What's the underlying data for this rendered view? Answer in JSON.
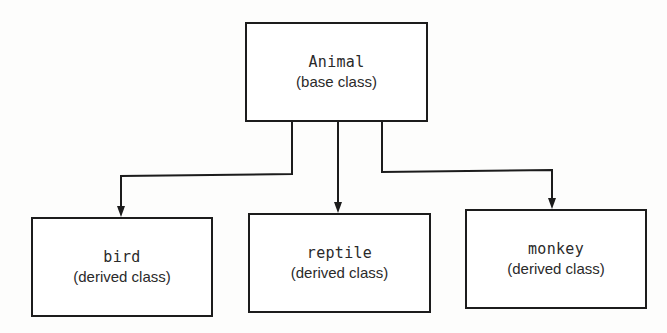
{
  "diagram": {
    "type": "class-hierarchy",
    "colors": {
      "stroke": "#1c1c1c",
      "text": "#2a2a2a",
      "background": "#fdfdfc",
      "box_fill": "#ffffff"
    },
    "nodes": [
      {
        "id": "animal",
        "name": "Animal",
        "kind": "(base class)",
        "x": 245,
        "y": 22,
        "w": 183,
        "h": 100
      },
      {
        "id": "bird",
        "name": "bird",
        "kind": "(derived class)",
        "x": 31,
        "y": 217,
        "w": 182,
        "h": 100
      },
      {
        "id": "reptile",
        "name": "reptile",
        "kind": "(derived class)",
        "x": 248,
        "y": 213,
        "w": 183,
        "h": 100
      },
      {
        "id": "monkey",
        "name": "monkey",
        "kind": "(derived class)",
        "x": 465,
        "y": 209,
        "w": 182,
        "h": 100
      }
    ],
    "edges": [
      {
        "from": "animal",
        "to": "bird",
        "points": [
          [
            292,
            122
          ],
          [
            292,
            174
          ],
          [
            121,
            176
          ],
          [
            121,
            217
          ]
        ]
      },
      {
        "from": "animal",
        "to": "reptile",
        "points": [
          [
            338,
            122
          ],
          [
            338,
            213
          ]
        ]
      },
      {
        "from": "animal",
        "to": "monkey",
        "points": [
          [
            382,
            122
          ],
          [
            382,
            172
          ],
          [
            552,
            170
          ],
          [
            552,
            209
          ]
        ]
      }
    ]
  }
}
